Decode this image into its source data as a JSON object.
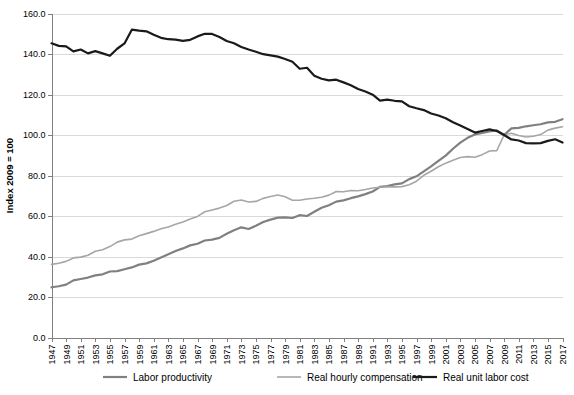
{
  "chart_data": {
    "type": "line",
    "title": "",
    "xlabel": "",
    "ylabel": "Index 2009 = 100",
    "ylim": [
      0,
      160
    ],
    "ytick_step": 20,
    "ytick_labels": [
      "0.0",
      "20.0",
      "40.0",
      "60.0",
      "80.0",
      "100.0",
      "120.0",
      "140.0",
      "160.0"
    ],
    "xlim": [
      1947,
      2017
    ],
    "xtick_labels": [
      "1947",
      "1949",
      "1951",
      "1953",
      "1955",
      "1957",
      "1959",
      "1961",
      "1963",
      "1965",
      "1967",
      "1969",
      "1971",
      "1973",
      "1975",
      "1977",
      "1979",
      "1981",
      "1983",
      "1985",
      "1987",
      "1989",
      "1991",
      "1993",
      "1995",
      "1997",
      "1999",
      "2001",
      "2003",
      "2005",
      "2007",
      "2009",
      "2011",
      "2013",
      "2015",
      "2017"
    ],
    "xtick_step": 2,
    "grid": "horizontal",
    "legend_position": "bottom",
    "x": [
      1947,
      1948,
      1949,
      1950,
      1951,
      1952,
      1953,
      1954,
      1955,
      1956,
      1957,
      1958,
      1959,
      1960,
      1961,
      1962,
      1963,
      1964,
      1965,
      1966,
      1967,
      1968,
      1969,
      1970,
      1971,
      1972,
      1973,
      1974,
      1975,
      1976,
      1977,
      1978,
      1979,
      1980,
      1981,
      1982,
      1983,
      1984,
      1985,
      1986,
      1987,
      1988,
      1989,
      1990,
      1991,
      1992,
      1993,
      1994,
      1995,
      1996,
      1997,
      1998,
      1999,
      2000,
      2001,
      2002,
      2003,
      2004,
      2005,
      2006,
      2007,
      2008,
      2009,
      2010,
      2011,
      2012,
      2013,
      2014,
      2015,
      2016,
      2017
    ],
    "series": [
      {
        "name": "Labor productivity",
        "color": "#808080",
        "width": 2.2,
        "values": [
          24.8,
          25.3,
          26.1,
          28.2,
          28.9,
          29.6,
          30.7,
          31.2,
          32.6,
          32.8,
          33.7,
          34.6,
          36.0,
          36.6,
          37.9,
          39.5,
          41.1,
          42.7,
          44.0,
          45.5,
          46.3,
          47.9,
          48.3,
          49.2,
          51.2,
          53.0,
          54.4,
          53.6,
          55.2,
          57.0,
          58.2,
          59.2,
          59.3,
          59.0,
          60.4,
          60.0,
          62.1,
          64.1,
          65.3,
          67.1,
          67.7,
          68.8,
          69.7,
          70.8,
          72.1,
          74.4,
          74.8,
          75.6,
          76.1,
          78.2,
          79.6,
          82.0,
          84.5,
          87.2,
          89.8,
          93.2,
          96.2,
          98.6,
          100.3,
          101.0,
          101.8,
          102.3,
          100.0,
          103.3,
          103.5,
          104.3,
          104.8,
          105.3,
          106.2,
          106.5,
          107.8
        ]
      },
      {
        "name": "Real hourly compensation",
        "color": "#a6a6a6",
        "width": 1.6,
        "values": [
          36.1,
          36.7,
          37.6,
          39.3,
          39.7,
          40.6,
          42.6,
          43.3,
          44.9,
          47.1,
          48.2,
          48.6,
          50.2,
          51.3,
          52.4,
          53.7,
          54.6,
          55.9,
          57.0,
          58.5,
          59.8,
          62.1,
          63.0,
          63.9,
          65.2,
          67.3,
          67.9,
          66.9,
          67.2,
          68.7,
          69.6,
          70.4,
          69.5,
          67.8,
          67.8,
          68.4,
          68.8,
          69.3,
          70.3,
          72.1,
          72.0,
          72.6,
          72.5,
          73.1,
          73.8,
          74.2,
          74.4,
          74.4,
          74.5,
          75.4,
          77.2,
          80.1,
          82.1,
          84.3,
          86.1,
          87.5,
          88.9,
          89.3,
          89.0,
          90.3,
          92.1,
          92.3,
          100.0,
          100.9,
          99.8,
          99.0,
          99.4,
          100.2,
          102.4,
          103.4,
          104.1
        ]
      },
      {
        "name": "Real unit labor cost",
        "color": "#1a1a1a",
        "width": 2.2,
        "values": [
          145.3,
          144.0,
          143.8,
          141.3,
          142.2,
          140.3,
          141.4,
          140.3,
          139.1,
          142.6,
          145.2,
          152.0,
          151.5,
          151.2,
          149.5,
          148.0,
          147.3,
          147.1,
          146.5,
          147.0,
          148.7,
          150.0,
          149.9,
          148.4,
          146.4,
          145.3,
          143.5,
          142.2,
          141.1,
          139.9,
          139.3,
          138.7,
          137.5,
          136.2,
          132.7,
          133.2,
          129.3,
          127.8,
          127.0,
          127.3,
          126.0,
          124.6,
          122.7,
          121.5,
          119.9,
          117.0,
          117.5,
          116.9,
          116.6,
          114.2,
          113.2,
          112.3,
          110.6,
          109.6,
          108.3,
          106.3,
          104.7,
          103.0,
          101.2,
          102.0,
          102.8,
          102.0,
          100.0,
          97.8,
          97.3,
          96.0,
          95.9,
          96.0,
          97.1,
          97.9,
          96.3
        ]
      }
    ]
  },
  "legend": {
    "items": [
      {
        "label": "Labor productivity"
      },
      {
        "label": "Real hourly compensation"
      },
      {
        "label": "Real unit labor cost"
      }
    ]
  },
  "axes": {
    "y_title": "Index 2009 = 100"
  }
}
